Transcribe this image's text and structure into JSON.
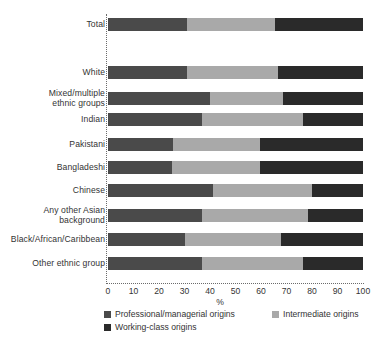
{
  "chart_data": {
    "type": "bar",
    "orientation": "horizontal",
    "stacked": true,
    "title": "",
    "xlabel": "%",
    "ylabel": "",
    "xlim": [
      0,
      100
    ],
    "grid": false,
    "legend_position": "bottom",
    "categories": [
      "Total",
      "White",
      "Mixed/multiple\nethnic groups",
      "Indian",
      "Pakistani",
      "Bangladeshi",
      "Chinese",
      "Any other Asian\nbackground",
      "Black/African/Caribbean",
      "Other ethnic group"
    ],
    "series": [
      {
        "name": "Professional/managerial origins",
        "color": "#4a4a4a",
        "values": [
          31,
          31,
          40,
          37,
          25.5,
          25,
          41,
          37,
          30,
          37
        ]
      },
      {
        "name": "Intermediate origins",
        "color": "#a9a9a9",
        "values": [
          34.5,
          35.5,
          28.5,
          39.5,
          34,
          34.5,
          39,
          41.5,
          38,
          39.5
        ]
      },
      {
        "name": "Working-class origins",
        "color": "#2a2a2a",
        "values": [
          34.5,
          33.5,
          31.5,
          23.5,
          40.5,
          40.5,
          20,
          21.5,
          32,
          23.5
        ]
      }
    ],
    "xticks": [
      {
        "value": 0,
        "label": "0"
      },
      {
        "value": 10,
        "label": "10"
      },
      {
        "value": 20,
        "label": "20"
      },
      {
        "value": 30,
        "label": "30"
      },
      {
        "value": 40,
        "label": "40"
      },
      {
        "value": 50,
        "label": "50"
      },
      {
        "value": 60,
        "label": "60"
      },
      {
        "value": 70,
        "label": "70"
      },
      {
        "value": 80,
        "label": "80"
      },
      {
        "value": 90,
        "label": "90"
      },
      {
        "value": 100,
        "label": "100"
      }
    ],
    "legend": [
      {
        "label": "Professional/managerial origins",
        "color": "#4a4a4a"
      },
      {
        "label": "Intermediate origins",
        "color": "#a9a9a9"
      },
      {
        "label": "Working-class origins",
        "color": "#2a2a2a"
      }
    ],
    "row_tops": [
      18,
      66,
      92,
      113,
      138,
      161,
      184,
      209,
      233,
      257
    ]
  }
}
